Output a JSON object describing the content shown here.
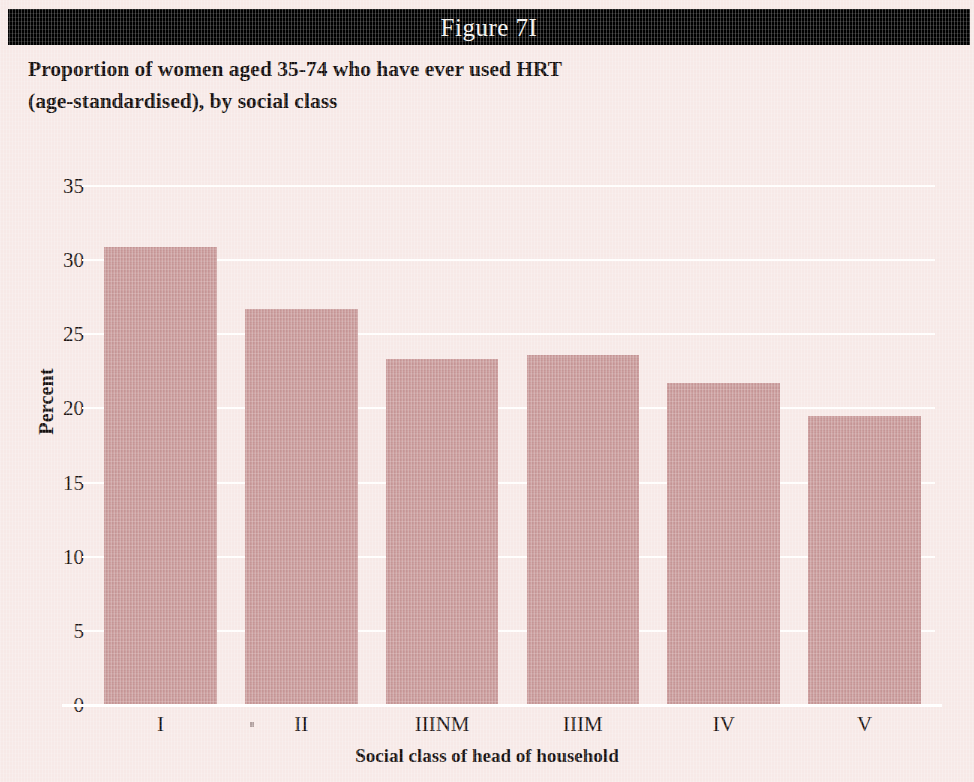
{
  "figure": {
    "banner_label": "Figure 7I",
    "heading_line1": "Proportion of women aged 35-74 who have ever used HRT",
    "heading_line2": "(age-standardised), by social class"
  },
  "colors": {
    "banner_background": "#000000",
    "banner_text": "#f4f2ef",
    "page_background": "#f7e9e7",
    "bar_fill": "#cb9a9a",
    "gridline": "#ffffff",
    "text": "#16100f"
  },
  "chart_data": {
    "type": "bar",
    "title": "Proportion of women aged 35-74 who have ever used HRT (age-standardised), by social class",
    "xlabel": "Social class of head of household",
    "ylabel": "Percent",
    "categories": [
      "I",
      "II",
      "IIINM",
      "IIIM",
      "IV",
      "V"
    ],
    "values": [
      30.9,
      26.7,
      23.3,
      23.6,
      21.7,
      19.5
    ],
    "ylim": [
      0,
      35
    ],
    "yticks": [
      0,
      5,
      10,
      15,
      20,
      25,
      30,
      35
    ],
    "ytick_labels": [
      "0",
      "5",
      "10",
      "15",
      "20",
      "25",
      "30",
      "35"
    ],
    "grid": true,
    "legend": false,
    "series": [
      {
        "name": "Ever used HRT (%)",
        "values": [
          30.9,
          26.7,
          23.3,
          23.6,
          21.7,
          19.5
        ]
      }
    ]
  }
}
